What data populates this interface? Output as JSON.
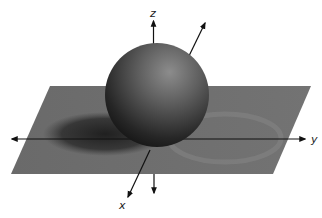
{
  "figure": {
    "axes": {
      "x_label": "x",
      "y_label": "y",
      "z_label": "z"
    },
    "colors": {
      "background": "#ffffff",
      "plane": "#6e6e6e",
      "shadow": "#2a2a2a",
      "sphere_light": "#8a8a8a",
      "sphere_dark": "#141414",
      "axis": "#111111"
    }
  }
}
